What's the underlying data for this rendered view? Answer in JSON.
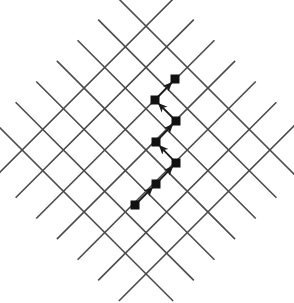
{
  "figure": {
    "title": "",
    "canvas": {
      "width": 294,
      "height": 303,
      "background": "#ffffff"
    }
  },
  "style": {
    "grid_line_color": "#4a4a4a",
    "grid_line_width": 1.6,
    "path_line_color": "#1a1a1a",
    "path_line_width": 1.8,
    "node_fill": "#111111",
    "node_size": 9,
    "arrow_color": "#1a1a1a"
  },
  "chart_data": {
    "type": "scatter",
    "title": "",
    "xlabel": "",
    "ylabel": "",
    "grid": true,
    "legend_position": "none",
    "axis_rotation_deg": 45,
    "lattice": {
      "center": {
        "x": 146,
        "y": 150
      },
      "spacing_perpendicular": 29.2,
      "direction_a_deg": 45,
      "direction_b_deg": -45,
      "lines_direction_a": 7,
      "lines_direction_b": 7,
      "line_half_length": 126,
      "offsets": [
        -87.6,
        -58.4,
        -29.2,
        0,
        29.2,
        58.4,
        87.6
      ]
    },
    "nodes": [
      {
        "index": 1,
        "x": 135,
        "y": 205,
        "label": ""
      },
      {
        "index": 2,
        "x": 156,
        "y": 184,
        "label": ""
      },
      {
        "index": 3,
        "x": 176,
        "y": 163,
        "label": ""
      },
      {
        "index": 4,
        "x": 156,
        "y": 142,
        "label": ""
      },
      {
        "index": 5,
        "x": 176,
        "y": 121,
        "label": ""
      },
      {
        "index": 6,
        "x": 155,
        "y": 100,
        "label": ""
      },
      {
        "index": 7,
        "x": 175,
        "y": 79,
        "label": ""
      }
    ],
    "edges": [
      {
        "from": 1,
        "to": 2,
        "direction": "up-right",
        "arrow": true
      },
      {
        "from": 2,
        "to": 3,
        "direction": "up-right",
        "arrow": true
      },
      {
        "from": 3,
        "to": 4,
        "direction": "up-left",
        "arrow": true
      },
      {
        "from": 4,
        "to": 5,
        "direction": "up-right",
        "arrow": true
      },
      {
        "from": 5,
        "to": 6,
        "direction": "up-left",
        "arrow": true
      },
      {
        "from": 6,
        "to": 7,
        "direction": "up-right",
        "arrow": true
      }
    ],
    "node_count": 7,
    "edge_count": 6
  }
}
